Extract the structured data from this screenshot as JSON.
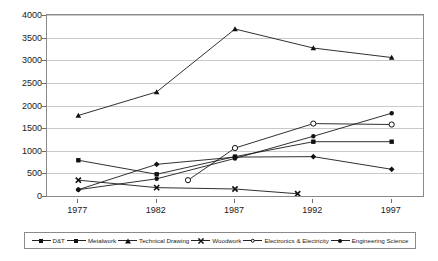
{
  "chart_data": {
    "type": "line",
    "title": "",
    "subtitle": "",
    "xlabel": "",
    "ylabel": "",
    "categories": [
      "1977",
      "1982",
      "1987",
      "1992",
      "1997"
    ],
    "x_values": [
      1977,
      1982,
      1987,
      1992,
      1997
    ],
    "xlim": [
      1975,
      1999
    ],
    "ylim": [
      0,
      4000
    ],
    "y_ticks": [
      0,
      500,
      1000,
      1500,
      2000,
      2500,
      3000,
      3500,
      4000
    ],
    "grid": true,
    "legend_position": "bottom",
    "series": [
      {
        "name": "D&T",
        "marker": "diamond",
        "x": [
          1977,
          1982,
          1987,
          1992,
          1997
        ],
        "values": [
          140,
          700,
          860,
          870,
          590
        ]
      },
      {
        "name": "Metalwork",
        "marker": "square",
        "x": [
          1977,
          1982,
          1987,
          1992,
          1997
        ],
        "values": [
          790,
          480,
          870,
          1200,
          1200
        ]
      },
      {
        "name": "Technical Drawing",
        "marker": "triangle",
        "x": [
          1977,
          1982,
          1987,
          1992,
          1997
        ],
        "values": [
          1780,
          2300,
          3690,
          3270,
          3060
        ]
      },
      {
        "name": "Woodwork",
        "marker": "cross",
        "x": [
          1977,
          1982,
          1987,
          1991
        ],
        "values": [
          350,
          185,
          155,
          50
        ]
      },
      {
        "name": "Electronics & Electricity",
        "marker": "circle",
        "x": [
          1984,
          1987,
          1992,
          1997
        ],
        "values": [
          350,
          1060,
          1600,
          1580
        ]
      },
      {
        "name": "Engineering Science",
        "marker": "dot",
        "x": [
          1977,
          1982,
          1987,
          1992,
          1997
        ],
        "values": [
          140,
          380,
          830,
          1320,
          1830
        ]
      }
    ],
    "colors": {
      "line": "#1a1a1a",
      "grid": "#c9c9c9",
      "frame": "#8a8a8a",
      "text": "#1a1a1a",
      "background": "#ffffff"
    }
  }
}
